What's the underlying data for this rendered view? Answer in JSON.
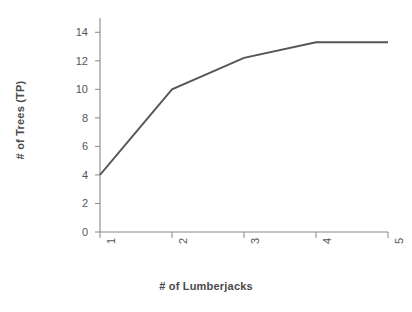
{
  "chart_data": {
    "type": "line",
    "title": "",
    "xlabel": "# of Lumberjacks",
    "ylabel": "# of Trees (TP)",
    "x": [
      1,
      2,
      3,
      4,
      5
    ],
    "values": [
      4,
      10,
      12.2,
      13.3,
      13.3
    ],
    "categories": [
      "1",
      "2",
      "3",
      "4",
      "5"
    ],
    "xtick_labels": [
      "1",
      "2",
      "3",
      "4",
      "5"
    ],
    "ytick_labels": [
      "0",
      "2",
      "4",
      "6",
      "8",
      "10",
      "12",
      "14"
    ],
    "ytick_values": [
      0,
      2,
      4,
      6,
      8,
      10,
      12,
      14
    ],
    "xlim": [
      1,
      5
    ],
    "ylim": [
      0,
      15
    ],
    "grid": false,
    "legend": null,
    "legend_position": "none",
    "line_color": "#555555",
    "axis_color": "#888888",
    "background_color": "#ffffff"
  }
}
